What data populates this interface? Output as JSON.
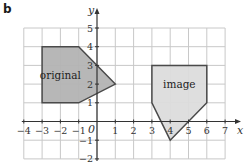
{
  "panel": {
    "label": "b"
  },
  "axes": {
    "x_label": "x",
    "y_label": "y",
    "origin_label": "0",
    "xlim": [
      -4,
      7
    ],
    "ylim": [
      -2,
      5
    ],
    "x_ticks": [
      -4,
      -3,
      -2,
      -1,
      1,
      2,
      3,
      4,
      5,
      6,
      7
    ],
    "y_ticks": [
      -2,
      -1,
      1,
      2,
      3,
      4,
      5
    ],
    "grid": true
  },
  "shapes": [
    {
      "name": "original",
      "label": "original",
      "vertices": [
        [
          -3,
          4
        ],
        [
          -1,
          4
        ],
        [
          1,
          2
        ],
        [
          -1,
          1
        ],
        [
          -3,
          1
        ]
      ],
      "label_pos": [
        -2,
        2.5
      ],
      "fill": "#b3b3b3",
      "stroke": "#4a4a4a"
    },
    {
      "name": "image",
      "label": "image",
      "vertices": [
        [
          3,
          3
        ],
        [
          6,
          3
        ],
        [
          6,
          1
        ],
        [
          4,
          -1
        ],
        [
          3,
          1
        ]
      ],
      "label_pos": [
        4.5,
        2
      ],
      "fill": "#dcdcdc",
      "stroke": "#4a4a4a"
    }
  ],
  "colors": {
    "grid": "#c8c8c8",
    "axis": "#333333"
  }
}
